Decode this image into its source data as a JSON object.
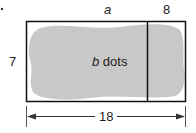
{
  "diagram": {
    "top_label_left": "a",
    "top_label_right": "8",
    "side_label": "7",
    "center_label_var": "b",
    "center_label_text": " dots",
    "bottom_label": "18",
    "colors": {
      "stroke": "#111111",
      "blob": "#c8c8c8"
    }
  }
}
